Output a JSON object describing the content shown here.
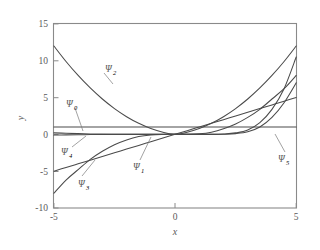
{
  "chart_data": {
    "type": "line",
    "title": "",
    "xlabel": "x",
    "ylabel": "y",
    "xlim": [
      -5,
      5
    ],
    "ylim": [
      -10,
      15
    ],
    "xticks": [
      -5,
      0,
      5
    ],
    "yticks": [
      15,
      10,
      5,
      0,
      -5,
      -10
    ],
    "xtick_labels": [
      "-5",
      "0",
      "5"
    ],
    "ytick_labels": [
      "15",
      "10",
      "5",
      "0",
      "-5",
      "-10"
    ],
    "grid": false,
    "legend": "inline-annotations",
    "x": [
      -5,
      -4.5,
      -4,
      -3.5,
      -3,
      -2.5,
      -2,
      -1.5,
      -1,
      -0.5,
      0,
      0.5,
      1,
      1.5,
      2,
      2.5,
      3,
      3.5,
      4,
      4.5,
      5
    ],
    "series": [
      {
        "name": "psi_0",
        "label": "Ψ",
        "subscript": "0",
        "values": [
          1,
          1,
          1,
          1,
          1,
          1,
          1,
          1,
          1,
          1,
          1,
          1,
          1,
          1,
          1,
          1,
          1,
          1,
          1,
          1,
          1
        ]
      },
      {
        "name": "psi_1",
        "label": "Ψ",
        "subscript": "1",
        "values": [
          -5,
          -4.5,
          -4,
          -3.5,
          -3,
          -2.5,
          -2,
          -1.5,
          -1,
          -0.5,
          0,
          0.5,
          1,
          1.5,
          2,
          2.5,
          3,
          3.5,
          4,
          4.5,
          5
        ]
      },
      {
        "name": "psi_2",
        "label": "Ψ",
        "subscript": "2",
        "values": [
          12,
          9.9,
          8,
          6.3,
          4.8,
          3.5,
          2.4,
          1.5,
          0.8,
          0.3,
          0,
          0.3,
          0.8,
          1.5,
          2.4,
          3.5,
          4.8,
          6.3,
          8,
          9.9,
          12
        ]
      },
      {
        "name": "psi_3",
        "label": "Ψ",
        "subscript": "3",
        "values": [
          -8,
          -6.2,
          -4.8,
          -3.4,
          -2.3,
          -1.4,
          -0.75,
          -0.3,
          -0.08,
          -0.01,
          0,
          0.01,
          0.08,
          0.3,
          0.75,
          1.4,
          2.3,
          3.4,
          4.8,
          6.2,
          8
        ]
      },
      {
        "name": "psi_4",
        "label": "Ψ",
        "subscript": "4",
        "values": [
          0.2,
          0.15,
          0.1,
          0.06,
          0.03,
          0.01,
          0,
          0,
          0,
          0,
          0,
          0,
          0,
          0,
          0.05,
          0.2,
          0.6,
          1.6,
          3.4,
          6.2,
          10.5
        ]
      },
      {
        "name": "psi_5",
        "label": "Ψ",
        "subscript": "5",
        "values": [
          -0.1,
          -0.07,
          -0.05,
          -0.03,
          -0.01,
          0,
          0,
          0,
          0,
          0,
          0,
          0,
          0,
          0,
          0.02,
          0.1,
          0.35,
          1,
          2.3,
          4.3,
          7
        ]
      }
    ],
    "annotations": [
      {
        "name": "psi-2-label",
        "label": "Ψ",
        "subscript": "2"
      },
      {
        "name": "psi-0-label",
        "label": "Ψ",
        "subscript": "0"
      },
      {
        "name": "psi-4-label",
        "label": "Ψ",
        "subscript": "4"
      },
      {
        "name": "psi-3-label",
        "label": "Ψ",
        "subscript": "3"
      },
      {
        "name": "psi-1-label",
        "label": "Ψ",
        "subscript": "1"
      },
      {
        "name": "psi-5-label",
        "label": "Ψ",
        "subscript": "5"
      }
    ],
    "colors": {
      "curve": "#4a4a4a",
      "frame": "#8a8a8a",
      "text": "#5a5a5a",
      "background": "#ffffff"
    }
  }
}
